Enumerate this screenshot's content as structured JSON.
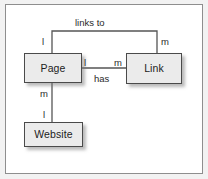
{
  "diagram": {
    "type": "entity-relationship-diagram",
    "background_color": "#f2f2f2",
    "canvas_color": "#ffffff",
    "border_color": "#8e8e8e",
    "entity_fill": "#ebebeb",
    "entity_border": "#4a4a4a",
    "line_color": "#555555",
    "entities": [
      {
        "id": "page",
        "label": "Page",
        "x": 24,
        "y": 53,
        "width": 58,
        "height": 30
      },
      {
        "id": "link",
        "label": "Link",
        "x": 126,
        "y": 53,
        "width": 56,
        "height": 31
      },
      {
        "id": "website",
        "label": "Website",
        "x": 24,
        "y": 122,
        "width": 59,
        "height": 25
      }
    ],
    "relationships": [
      {
        "id": "links-to",
        "label": "links to",
        "from": "page",
        "to": "link",
        "from_cardinality": "l",
        "to_cardinality": "m"
      },
      {
        "id": "has",
        "label": "has",
        "from": "page",
        "to": "link",
        "from_cardinality": "l",
        "to_cardinality": "m"
      },
      {
        "id": "page-website",
        "label": "",
        "from": "page",
        "to": "website",
        "from_cardinality": "m",
        "to_cardinality": "l"
      }
    ],
    "labels": {
      "links_to": "links to",
      "has": "has",
      "links_to_left_card": "l",
      "links_to_right_card": "m",
      "has_left_card": "l",
      "has_right_card": "m",
      "website_top_card": "m",
      "website_bottom_card": "l"
    }
  }
}
